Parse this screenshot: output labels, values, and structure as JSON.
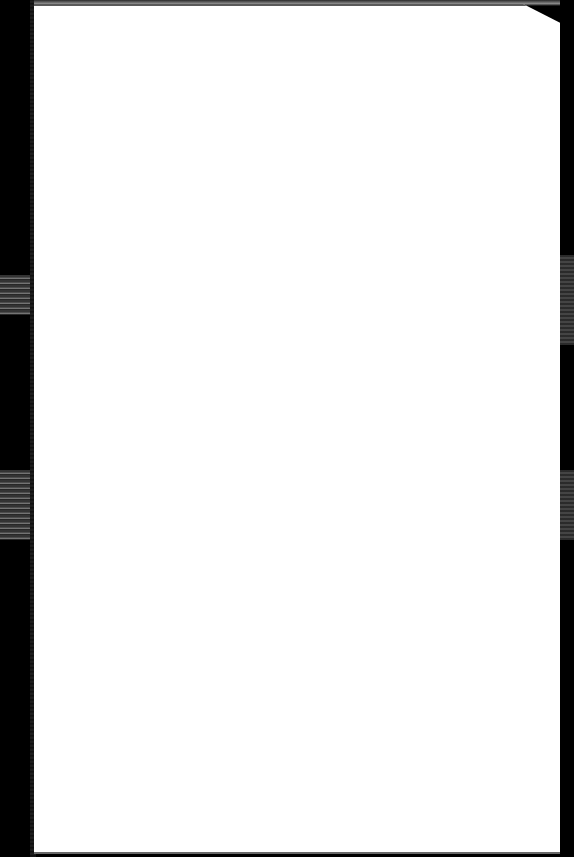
{
  "document": {
    "type": "scanned-page",
    "content": "",
    "colors": {
      "page": "#ffffff",
      "background": "#000000"
    }
  }
}
